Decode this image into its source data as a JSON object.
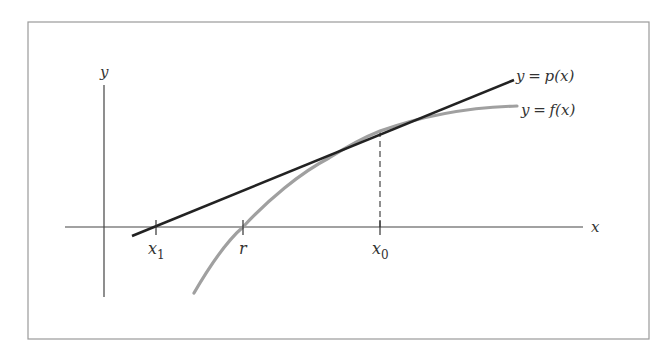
{
  "figure": {
    "frame_color": "#9a9a9a",
    "axes": {
      "x_label": "x",
      "y_label": "y",
      "color": "#444444"
    },
    "tangent_line": {
      "label": "y = p(x)",
      "label_parts": {
        "lhs": "y",
        "eq": "=",
        "rhs": "p(x)"
      },
      "color": "#222222"
    },
    "curve": {
      "label": "y = f(x)",
      "label_parts": {
        "lhs": "y",
        "eq": "=",
        "rhs": "f(x)"
      },
      "color": "#a0a0a0"
    },
    "ticks": [
      {
        "name": "x1",
        "base": "x",
        "subscript": "1"
      },
      {
        "name": "r",
        "base": "r",
        "subscript": ""
      },
      {
        "name": "x0",
        "base": "x",
        "subscript": "0"
      }
    ],
    "dashed_guide": {
      "from": "x0 on x-axis",
      "to": "point (x0, f(x0))"
    }
  }
}
